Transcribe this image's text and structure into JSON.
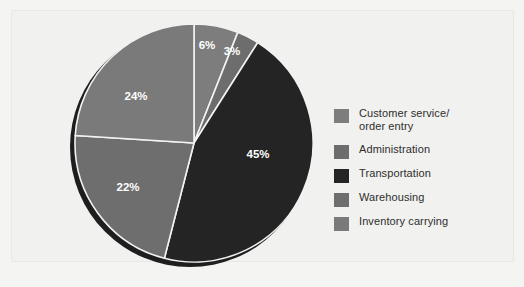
{
  "figure": {
    "background_color": "#f1f1ef",
    "panel_border_color": "#e8e8e6"
  },
  "chart_data": {
    "type": "pie",
    "title": "",
    "subtitle": "",
    "xlabel": "",
    "ylabel": "",
    "grid": false,
    "legend_position": "right",
    "start_angle_deg": 0,
    "direction": "clockwise",
    "categories": [
      "Customer service/ order entry",
      "Administration",
      "Transportation",
      "Warehousing",
      "Inventory carrying"
    ],
    "values": [
      6,
      3,
      45,
      22,
      24
    ],
    "value_labels": [
      "6%",
      "3%",
      "45%",
      "22%",
      "24%"
    ],
    "colors": [
      "#7d7d7d",
      "#6d6d6d",
      "#242424",
      "#6e6e6e",
      "#7a7a7a"
    ],
    "slice_separator_color": "#f2f2f2",
    "label_text_color": "#ffffff",
    "has_3d_shadow": true,
    "shadow_color": "#1e1e1e"
  },
  "pie": {
    "center_x": 134,
    "center_y": 131,
    "radius": 119,
    "slices": [
      {
        "name": "customer-service-order-entry",
        "label": "6%",
        "value": 6,
        "color": "#7d7d7d",
        "start_deg": 0,
        "end_deg": 21.6,
        "label_x": 147,
        "label_y": 34
      },
      {
        "name": "administration",
        "label": "3%",
        "value": 3,
        "color": "#6d6d6d",
        "start_deg": 21.6,
        "end_deg": 32.4,
        "label_x": 172,
        "label_y": 40
      },
      {
        "name": "transportation",
        "label": "45%",
        "value": 45,
        "color": "#242424",
        "start_deg": 32.4,
        "end_deg": 194.4,
        "label_x": 198,
        "label_y": 143
      },
      {
        "name": "warehousing",
        "label": "22%",
        "value": 22,
        "color": "#6e6e6e",
        "start_deg": 194.4,
        "end_deg": 273.6,
        "label_x": 68,
        "label_y": 176
      },
      {
        "name": "inventory-carrying",
        "label": "24%",
        "value": 24,
        "color": "#7a7a7a",
        "start_deg": 273.6,
        "end_deg": 360,
        "label_x": 76,
        "label_y": 85
      }
    ]
  },
  "legend": {
    "items": [
      {
        "label": "Customer service/\norder entry",
        "color": "#7d7d7d",
        "name": "customer-service-order-entry"
      },
      {
        "label": "Administration",
        "color": "#6d6d6d",
        "name": "administration"
      },
      {
        "label": "Transportation",
        "color": "#242424",
        "name": "transportation"
      },
      {
        "label": "Warehousing",
        "color": "#6e6e6e",
        "name": "warehousing"
      },
      {
        "label": "Inventory carrying",
        "color": "#7a7a7a",
        "name": "inventory-carrying"
      }
    ]
  }
}
